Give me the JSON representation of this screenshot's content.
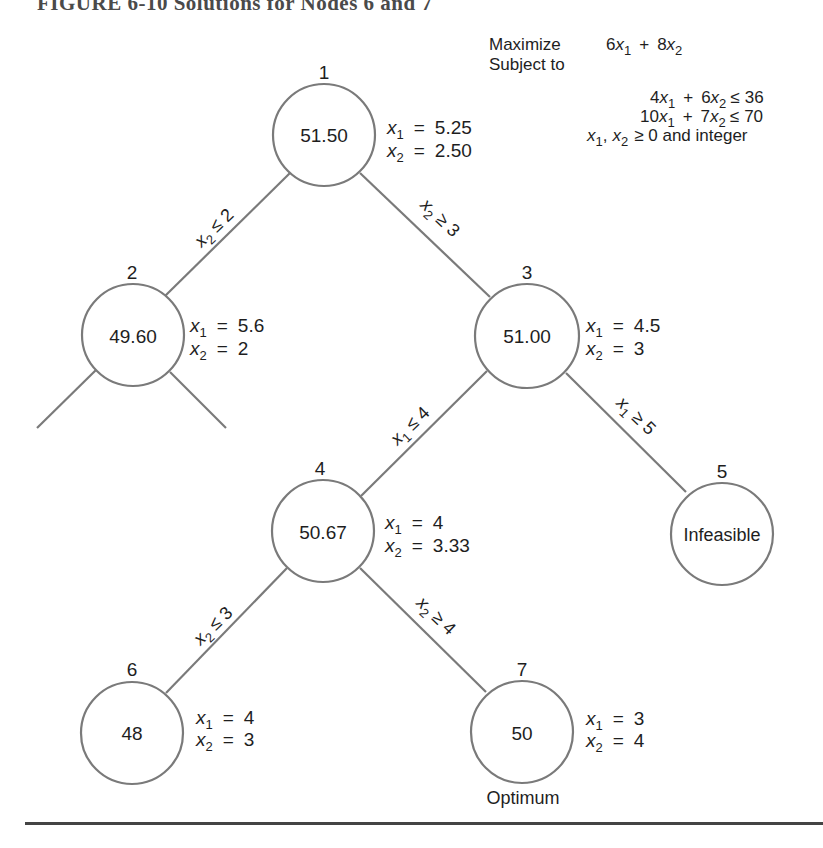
{
  "figure": {
    "title": "FIGURE 6-10   Solutions for Nodes 6 and 7"
  },
  "model": {
    "maximize_label": "Maximize",
    "subject_to_label": "Subject to",
    "objective": {
      "c1": "6",
      "c2": "8"
    },
    "constraints": [
      {
        "c1": "4",
        "c2": "6",
        "op": "≤",
        "rhs": "36"
      },
      {
        "c1": "10",
        "c2": "7",
        "op": "≤",
        "rhs": "70"
      }
    ],
    "nonneg": "≥  0 and integer"
  },
  "nodes": [
    {
      "id": "1",
      "value": "51.50",
      "x1": "5.25",
      "x2": "2.50"
    },
    {
      "id": "2",
      "value": "49.60",
      "x1": "5.6",
      "x2": "2"
    },
    {
      "id": "3",
      "value": "51.00",
      "x1": "4.5",
      "x2": "3"
    },
    {
      "id": "4",
      "value": "50.67",
      "x1": "4",
      "x2": "3.33"
    },
    {
      "id": "5",
      "value": "Infeasible"
    },
    {
      "id": "6",
      "value": "48",
      "x1": "4",
      "x2": "3"
    },
    {
      "id": "7",
      "value": "50",
      "x1": "3",
      "x2": "4",
      "note": "Optimum"
    }
  ],
  "edges": [
    {
      "from": "1",
      "to": "2",
      "var": "x",
      "sub": "2",
      "op": "≤",
      "rhs": "2"
    },
    {
      "from": "1",
      "to": "3",
      "var": "x",
      "sub": "2",
      "op": "≥",
      "rhs": "3"
    },
    {
      "from": "3",
      "to": "4",
      "var": "x",
      "sub": "1",
      "op": "≤",
      "rhs": "4"
    },
    {
      "from": "3",
      "to": "5",
      "var": "x",
      "sub": "1",
      "op": "≥",
      "rhs": "5"
    },
    {
      "from": "4",
      "to": "6",
      "var": "x",
      "sub": "2",
      "op": "≤",
      "rhs": "3"
    },
    {
      "from": "4",
      "to": "7",
      "var": "x",
      "sub": "2",
      "op": "≥",
      "rhs": "4"
    }
  ],
  "labels": {
    "eq": "=",
    "plus": "+",
    "x": "x",
    "one": "1",
    "two": "2",
    "comma": ",",
    "nonneg_lhs_sep": ", "
  }
}
